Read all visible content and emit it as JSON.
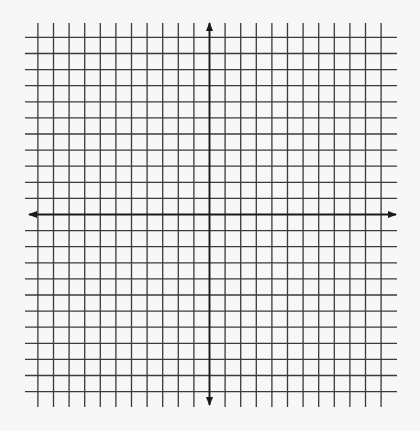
{
  "figure": {
    "type": "coordinate-plane",
    "grid": {
      "columns_left_of_y_axis": 11,
      "columns_right_of_y_axis": 11,
      "rows_above_x_axis": 11,
      "rows_below_x_axis": 11
    },
    "axes": {
      "x_axis": {
        "arrows": [
          "left",
          "right"
        ],
        "label": ""
      },
      "y_axis": {
        "arrows": [
          "up",
          "down"
        ],
        "label": ""
      }
    },
    "colors": {
      "background": "#f7f7f7",
      "grid": "#3a3a3a",
      "axis": "#1a1a1a"
    }
  }
}
